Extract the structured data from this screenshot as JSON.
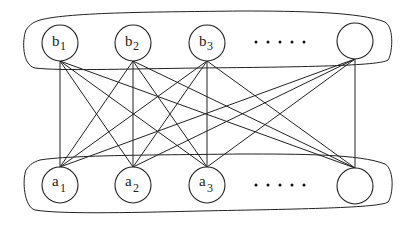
{
  "diagram": {
    "type": "complete-bipartite-graph",
    "top_group": {
      "name": "b-set",
      "nodes": [
        {
          "id": "b1",
          "base": "b",
          "sub": "1",
          "cx": 60,
          "cy": 43
        },
        {
          "id": "b2",
          "base": "b",
          "sub": "2",
          "cx": 133,
          "cy": 43
        },
        {
          "id": "b3",
          "base": "b",
          "sub": "3",
          "cx": 207,
          "cy": 43
        },
        {
          "id": "bn",
          "base": "",
          "sub": "",
          "cx": 355,
          "cy": 41
        }
      ],
      "ellipsis": "....."
    },
    "bottom_group": {
      "name": "a-set",
      "nodes": [
        {
          "id": "a1",
          "base": "a",
          "sub": "1",
          "cx": 60,
          "cy": 185
        },
        {
          "id": "a2",
          "base": "a",
          "sub": "2",
          "cx": 133,
          "cy": 185
        },
        {
          "id": "a3",
          "base": "a",
          "sub": "3",
          "cx": 207,
          "cy": 185
        },
        {
          "id": "an",
          "base": "",
          "sub": "",
          "cx": 355,
          "cy": 186
        }
      ],
      "ellipsis": "....."
    },
    "edges": "every top node connected to every bottom node",
    "colors": {
      "line": "#222222",
      "background": "#ffffff"
    }
  },
  "labels": {
    "b1": "b",
    "b1_sub": "1",
    "b2": "b",
    "b2_sub": "2",
    "b3": "b",
    "b3_sub": "3",
    "a1": "a",
    "a1_sub": "1",
    "a2": "a",
    "a2_sub": "2",
    "a3": "a",
    "a3_sub": "3"
  }
}
